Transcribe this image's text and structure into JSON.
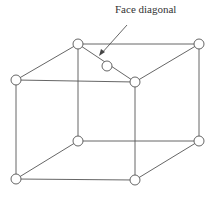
{
  "diagram": {
    "type": "cubic-lattice-face-centered",
    "label": "Face diagonal",
    "line_color": "#555555",
    "atoms": [
      {
        "name": "top-back-left",
        "x": 78,
        "y": 44
      },
      {
        "name": "top-back-right",
        "x": 199,
        "y": 44
      },
      {
        "name": "top-front-left",
        "x": 16,
        "y": 80
      },
      {
        "name": "top-front-right",
        "x": 135,
        "y": 82
      },
      {
        "name": "top-face-center",
        "x": 107,
        "y": 66
      },
      {
        "name": "bottom-back-left",
        "x": 78,
        "y": 141
      },
      {
        "name": "bottom-back-right",
        "x": 199,
        "y": 141
      },
      {
        "name": "bottom-front-left",
        "x": 16,
        "y": 179
      },
      {
        "name": "bottom-front-right",
        "x": 135,
        "y": 180
      }
    ]
  }
}
